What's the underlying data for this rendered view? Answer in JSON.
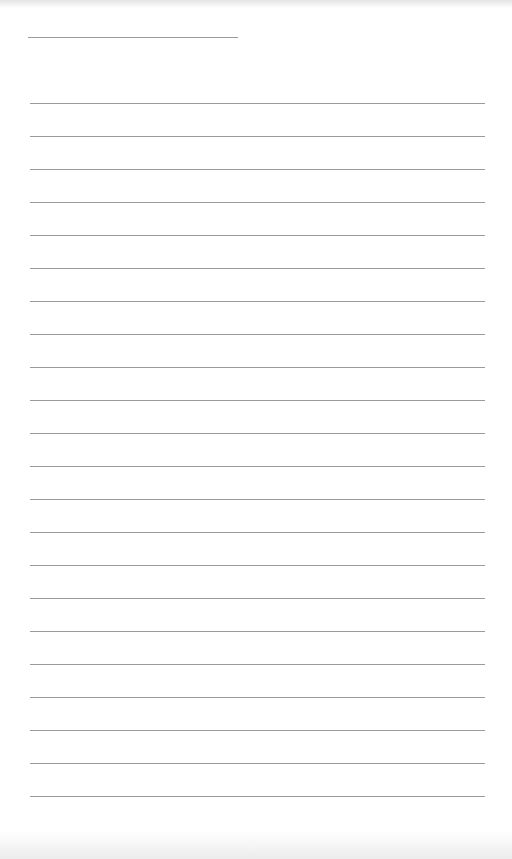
{
  "page": {
    "type": "lined-notepaper",
    "background_color": "#ffffff",
    "line_color": "#8a8a8a",
    "header_line": {
      "x": 28,
      "y": 37,
      "width": 210
    },
    "ruled_lines": {
      "count": 22,
      "first_y": 103,
      "spacing": 33,
      "x": 30,
      "width": 455
    }
  }
}
